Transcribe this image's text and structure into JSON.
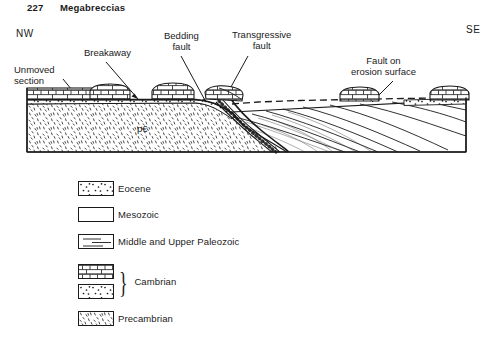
{
  "header": {
    "page_number": "227",
    "running_title": "Megabreccias"
  },
  "orientation": {
    "left_label": "NW",
    "right_label": "SE"
  },
  "cross_section": {
    "unit_label_precambrian": "p€",
    "callouts": [
      {
        "id": "unmoved-section",
        "line1": "Unmoved",
        "line2": "section"
      },
      {
        "id": "breakaway",
        "line1": "Breakaway",
        "line2": ""
      },
      {
        "id": "bedding-fault",
        "line1": "Bedding",
        "line2": "fault"
      },
      {
        "id": "transgressive-fault",
        "line1": "Transgressive",
        "line2": "fault"
      },
      {
        "id": "fault-on-erosion-surface",
        "line1": "Fault on",
        "line2": "erosion surface"
      }
    ]
  },
  "legend": {
    "items": [
      {
        "id": "eocene",
        "label": "Eocene",
        "pattern": "sparse-dots"
      },
      {
        "id": "mesozoic",
        "label": "Mesozoic",
        "pattern": "blank"
      },
      {
        "id": "middle-upper-paleozoic",
        "label": "Middle and Upper Paleozoic",
        "pattern": "dashed-lines"
      },
      {
        "id": "cambrian",
        "label": "Cambrian",
        "pattern": "brick-over-dots"
      },
      {
        "id": "precambrian",
        "label": "Precambrian",
        "pattern": "stipple"
      }
    ],
    "cambrian_brace": "}"
  },
  "colors": {
    "ink": "#1a1a1a",
    "paper": "#ffffff"
  }
}
